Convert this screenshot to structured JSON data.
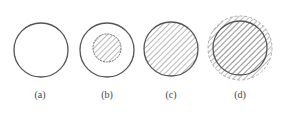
{
  "figures": [
    {
      "id": "a",
      "label": "(a)",
      "cx": 41,
      "cy": 50,
      "r": 27,
      "fill": "none"
    },
    {
      "id": "b",
      "label": "(b)",
      "cx": 107,
      "cy": 50,
      "r": 27,
      "fill": "none",
      "inner_r": 14,
      "inner_fill": "hatch"
    },
    {
      "id": "c",
      "label": "(c)",
      "cx": 171,
      "cy": 49,
      "r": 27,
      "fill": "hatch"
    },
    {
      "id": "d",
      "label": "(d)",
      "cx": 240,
      "cy": 48,
      "r": 27,
      "fill": "hatch",
      "outer_ring_r": 32,
      "ring_fill": "hatch"
    }
  ],
  "colors": {
    "stroke": "#555555",
    "hatch": "#888888",
    "background": "#ffffff"
  }
}
